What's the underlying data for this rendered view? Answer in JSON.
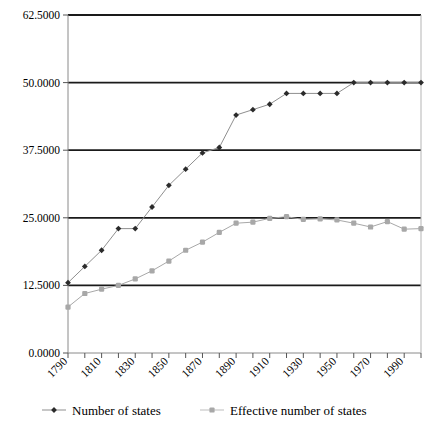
{
  "chart_data": {
    "type": "line",
    "title": "",
    "subtitle": "",
    "xlabel": "",
    "ylabel": "",
    "xlim": [
      1790,
      2000
    ],
    "ylim": [
      0.0,
      62.5
    ],
    "grid": true,
    "legend_position": "bottom",
    "y_ticks": [
      "0.0000",
      "12.5000",
      "25.0000",
      "37.5000",
      "50.0000",
      "62.5000"
    ],
    "y_tick_values": [
      0.0,
      12.5,
      25.0,
      37.5,
      50.0,
      62.5
    ],
    "x_tick_labels": [
      "1790",
      "1810",
      "1830",
      "1850",
      "1870",
      "1890",
      "1910",
      "1930",
      "1950",
      "1970",
      "1990"
    ],
    "x": [
      1790,
      1800,
      1810,
      1820,
      1830,
      1840,
      1850,
      1860,
      1870,
      1880,
      1890,
      1900,
      1910,
      1920,
      1930,
      1940,
      1950,
      1960,
      1970,
      1980,
      1990,
      2000
    ],
    "series": [
      {
        "name": "Number of states",
        "color": "#2b2b2b",
        "marker": "diamond",
        "values": [
          13,
          16,
          19,
          23,
          23,
          27,
          31,
          34,
          37,
          38,
          44,
          45,
          46,
          48,
          48,
          48,
          48,
          50,
          50,
          50,
          50,
          50
        ]
      },
      {
        "name": "Effective number of states",
        "color": "#a8a8a8",
        "marker": "square",
        "values": [
          8.5,
          11.0,
          11.8,
          12.5,
          13.7,
          15.2,
          17.0,
          19.0,
          20.5,
          22.3,
          24.0,
          24.2,
          24.9,
          25.2,
          24.7,
          24.8,
          24.6,
          24.0,
          23.3,
          24.3,
          22.9,
          23.0
        ]
      }
    ]
  },
  "legend": {
    "items": [
      {
        "label": "Number of states",
        "color": "#2b2b2b"
      },
      {
        "label": "Effective number of states",
        "color": "#a8a8a8"
      }
    ]
  }
}
